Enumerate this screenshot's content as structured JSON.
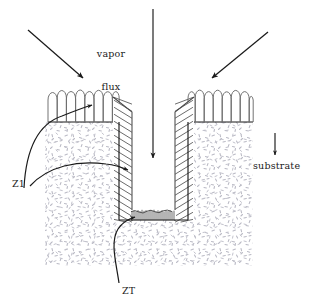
{
  "figure": {
    "type": "schematic-cross-section",
    "background_color": "#ffffff",
    "line_color": "#1a1a1a",
    "stipple_color": "#b9b9c4",
    "film_color": "#555555"
  },
  "labels": {
    "vapor_flux": "vapor\nflux",
    "vapor_flux_line1": "vapor",
    "vapor_flux_line2": "flux",
    "substrate": "substrate",
    "zone_1": "Z1",
    "zone_t": "ZT"
  },
  "arrows": [
    {
      "name": "vapor-flux-arrow-left",
      "description": "incident vapor flux from upper left",
      "x1": 28,
      "y1": 30,
      "x2": 84,
      "y2": 79,
      "direction": "down-right"
    },
    {
      "name": "vapor-flux-arrow-center",
      "description": "normal-incidence vapor flux into trench",
      "x1": 153,
      "y1": 9,
      "x2": 153,
      "y2": 160,
      "direction": "down"
    },
    {
      "name": "vapor-flux-arrow-right",
      "description": "incident vapor flux from upper right",
      "x1": 268,
      "y1": 32,
      "x2": 211,
      "y2": 79,
      "direction": "down-left"
    },
    {
      "name": "substrate-pointer-arrow",
      "description": "arrow pointing down to substrate label",
      "x1": 275,
      "y1": 133,
      "x2": 275,
      "y2": 156,
      "direction": "down"
    }
  ],
  "leaders": [
    {
      "name": "z1-leader-to-top-film",
      "from_label": "Z1",
      "target": "columnar film on top surface",
      "style": "curved"
    },
    {
      "name": "z1-leader-to-sidewall-film",
      "from_label": "Z1",
      "target": "tilted columnar film on trench sidewall",
      "style": "curved"
    },
    {
      "name": "zt-leader-to-trench-floor",
      "from_label": "ZT",
      "target": "fine-grained film on trench floor",
      "style": "curved"
    }
  ],
  "geometry": {
    "substrate": {
      "left": 45,
      "right": 253,
      "top": 122,
      "bottom": 266
    },
    "trench": {
      "left": 119,
      "right": 188,
      "top": 122,
      "bottom": 220
    },
    "top_surface_y": 122,
    "film_regions": [
      {
        "name": "top-left-film",
        "type": "vertical-columns",
        "x_from": 48,
        "x_to": 119
      },
      {
        "name": "top-right-film",
        "type": "vertical-columns",
        "x_from": 188,
        "x_to": 253
      },
      {
        "name": "left-sidewall-film",
        "type": "tilted-columns",
        "tilt": "down-left"
      },
      {
        "name": "right-sidewall-film",
        "type": "tilted-columns",
        "tilt": "down-right"
      },
      {
        "name": "trench-floor-film",
        "type": "fine-columns"
      }
    ]
  }
}
